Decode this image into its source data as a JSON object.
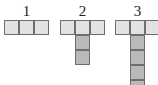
{
  "diagram": {
    "figures": [
      {
        "label": "1",
        "top_cells": 3,
        "stem_cells": 0
      },
      {
        "label": "2",
        "top_cells": 3,
        "stem_cells": 2
      },
      {
        "label": "3",
        "top_cells": 3,
        "stem_cells": 4
      }
    ],
    "colors": {
      "top_cell_fill": "#e2e2e2",
      "stem_cell_fill": "#b9b9b9",
      "cell_border": "#6e6e6e",
      "label": "#222222"
    }
  }
}
